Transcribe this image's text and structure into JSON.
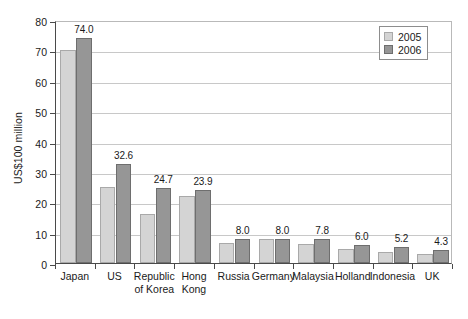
{
  "chart_data": {
    "type": "bar",
    "title": "",
    "xlabel": "",
    "ylabel": "US$100 million",
    "ylim": [
      0,
      80
    ],
    "yticks": [
      0,
      10,
      20,
      30,
      40,
      50,
      60,
      70,
      80
    ],
    "grid": true,
    "legend_position": "top-right",
    "categories": [
      "Japan",
      "US",
      "Republic of Korea",
      "Hong Kong",
      "Russia",
      "Germany",
      "Malaysia",
      "Holland",
      "Indonesia",
      "UK"
    ],
    "category_lines": [
      [
        "Japan"
      ],
      [
        "US"
      ],
      [
        "Republic",
        "of Korea"
      ],
      [
        "Hong",
        "Kong"
      ],
      [
        "Russia"
      ],
      [
        "Germany"
      ],
      [
        "Malaysia"
      ],
      [
        "Holland"
      ],
      [
        "Indonesia"
      ],
      [
        "UK"
      ]
    ],
    "series": [
      {
        "name": "2005",
        "color": "#d4d4d4",
        "values": [
          70.0,
          25.0,
          16.0,
          22.0,
          6.5,
          8.0,
          6.3,
          4.5,
          3.5,
          3.0
        ],
        "labels": [
          "",
          "",
          "",
          "",
          "",
          "",
          "",
          "",
          "",
          ""
        ]
      },
      {
        "name": "2006",
        "color": "#969696",
        "values": [
          74.0,
          32.6,
          24.7,
          23.9,
          8.0,
          8.0,
          7.8,
          6.0,
          5.2,
          4.3
        ],
        "labels": [
          "74.0",
          "32.6",
          "24.7",
          "23.9",
          "8.0",
          "8.0",
          "7.8",
          "6.0",
          "5.2",
          "4.3"
        ]
      }
    ]
  },
  "legend": {
    "items": [
      {
        "label": "2005"
      },
      {
        "label": "2006"
      }
    ]
  }
}
